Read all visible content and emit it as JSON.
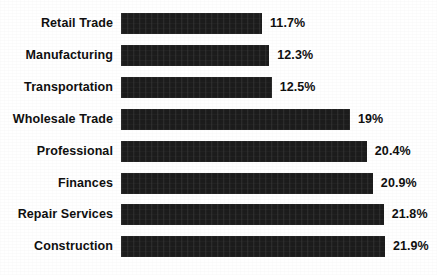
{
  "chart_data": {
    "type": "bar",
    "orientation": "horizontal",
    "title": "",
    "subtitle": "",
    "xlabel": "",
    "ylabel": "",
    "legend": [],
    "grid": false,
    "axis_visible": false,
    "value_suffix": "%",
    "xlim": [
      0,
      21.9
    ],
    "categories": [
      "Retail Trade",
      "Manufacturing",
      "Transportation",
      "Wholesale Trade",
      "Professional",
      "Finances",
      "Repair Services",
      "Construction"
    ],
    "values": [
      11.7,
      12.3,
      12.5,
      19,
      20.4,
      20.9,
      21.8,
      21.9
    ],
    "value_labels": [
      "11.7%",
      "12.3%",
      "12.5%",
      "19%",
      "20.4%",
      "20.9%",
      "21.8%",
      "21.9%"
    ],
    "bar_color": "#1c1c1c",
    "background_color": "#ffffff",
    "text_color": "#101010"
  }
}
